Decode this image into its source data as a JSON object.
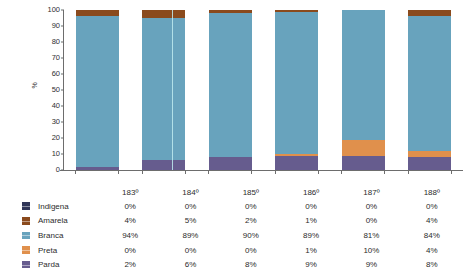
{
  "chart_data": {
    "type": "bar",
    "stacked": true,
    "title": "",
    "subtitle": "",
    "xlabel": "",
    "ylabel": "%",
    "ylim": [
      0,
      100
    ],
    "ytick_values": [
      0,
      10,
      20,
      30,
      40,
      50,
      60,
      70,
      80,
      90,
      100
    ],
    "ytick_labels": [
      "0",
      "10",
      "20",
      "30",
      "40",
      "50",
      "60",
      "70",
      "80",
      "90",
      "100"
    ],
    "grid": false,
    "legend_position": "bottom-table",
    "categories": [
      "183º",
      "184º",
      "185º",
      "186º",
      "187º",
      "188º"
    ],
    "series": [
      {
        "name": "Indigena",
        "color": "#2f3557",
        "values": [
          0,
          0,
          0,
          0,
          0,
          0
        ],
        "labels": [
          "0%",
          "0%",
          "0%",
          "0%",
          "0%",
          "0%"
        ]
      },
      {
        "name": "Amarela",
        "color": "#8a4a1d",
        "values": [
          4,
          5,
          2,
          1,
          0,
          4
        ],
        "labels": [
          "4%",
          "5%",
          "2%",
          "1%",
          "0%",
          "4%"
        ]
      },
      {
        "name": "Branca",
        "color": "#68a3bd",
        "values": [
          94,
          89,
          90,
          89,
          81,
          84
        ],
        "labels": [
          "94%",
          "89%",
          "90%",
          "89%",
          "81%",
          "84%"
        ]
      },
      {
        "name": "Preta",
        "color": "#e0904c",
        "values": [
          0,
          0,
          0,
          1,
          10,
          4
        ],
        "labels": [
          "0%",
          "0%",
          "0%",
          "1%",
          "10%",
          "4%"
        ]
      },
      {
        "name": "Parda",
        "color": "#665c8e",
        "values": [
          2,
          6,
          8,
          9,
          9,
          8
        ],
        "labels": [
          "2%",
          "6%",
          "8%",
          "9%",
          "9%",
          "8%"
        ]
      }
    ],
    "stack_order_bottom_to_top": [
      "Parda",
      "Preta",
      "Branca",
      "Amarela",
      "Indigena"
    ]
  },
  "table": {
    "corner_label": "",
    "column_headers": [
      "183º",
      "184º",
      "185º",
      "186º",
      "187º",
      "188º"
    ],
    "rows": [
      {
        "label": "Indigena",
        "color": "#2f3557",
        "values": [
          "0%",
          "0%",
          "0%",
          "0%",
          "0%",
          "0%"
        ]
      },
      {
        "label": "Amarela",
        "color": "#8a4a1d",
        "values": [
          "4%",
          "5%",
          "2%",
          "1%",
          "0%",
          "4%"
        ]
      },
      {
        "label": "Branca",
        "color": "#68a3bd",
        "values": [
          "94%",
          "89%",
          "90%",
          "89%",
          "81%",
          "84%"
        ]
      },
      {
        "label": "Preta",
        "color": "#e0904c",
        "values": [
          "0%",
          "0%",
          "0%",
          "1%",
          "10%",
          "4%"
        ]
      },
      {
        "label": "Parda",
        "color": "#665c8e",
        "values": [
          "2%",
          "6%",
          "8%",
          "9%",
          "9%",
          "8%"
        ]
      }
    ]
  },
  "axis": {
    "y_title": "%"
  }
}
